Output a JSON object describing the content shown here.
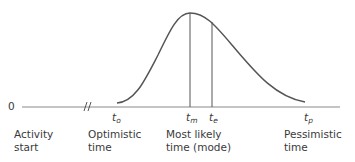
{
  "diagram": {
    "type": "beta-distribution-time-estimate",
    "origin_label": "0",
    "ticks": [
      {
        "id": "to",
        "symbol": "t",
        "subscript": "o"
      },
      {
        "id": "tm",
        "symbol": "t",
        "subscript": "m"
      },
      {
        "id": "te",
        "symbol": "t",
        "subscript": "e"
      },
      {
        "id": "tp",
        "symbol": "t",
        "subscript": "p"
      }
    ],
    "labels": {
      "activity_start": [
        "Activity",
        "start"
      ],
      "optimistic": [
        "Optimistic",
        "time"
      ],
      "most_likely": [
        "Most likely",
        "time (mode)"
      ],
      "pessimistic": [
        "Pessimistic",
        "time"
      ]
    },
    "colors": {
      "line": "#555555",
      "axis": "#8a8a8a",
      "text": "#3a3a3a"
    }
  }
}
